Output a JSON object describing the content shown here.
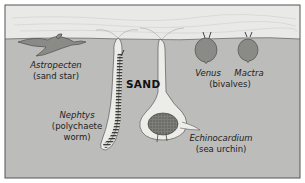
{
  "diagram": {
    "region_label": "SAND",
    "colors": {
      "water": "#e9e9e7",
      "sand": "#bcbcba",
      "border": "#555555",
      "burrow": "#ecece8",
      "organism": "#8a8a86",
      "organism_dark": "#5a5a56"
    },
    "organisms": [
      {
        "name": "Astropecten",
        "common": "(sand star)"
      },
      {
        "name": "Nephtys",
        "common_line1": "(polychaete",
        "common_line2": "worm)"
      },
      {
        "name": "Echinocardium",
        "common": "(sea urchin)"
      },
      {
        "name": "Venus",
        "group": "(bivalves)"
      },
      {
        "name": "Mactra"
      }
    ]
  }
}
